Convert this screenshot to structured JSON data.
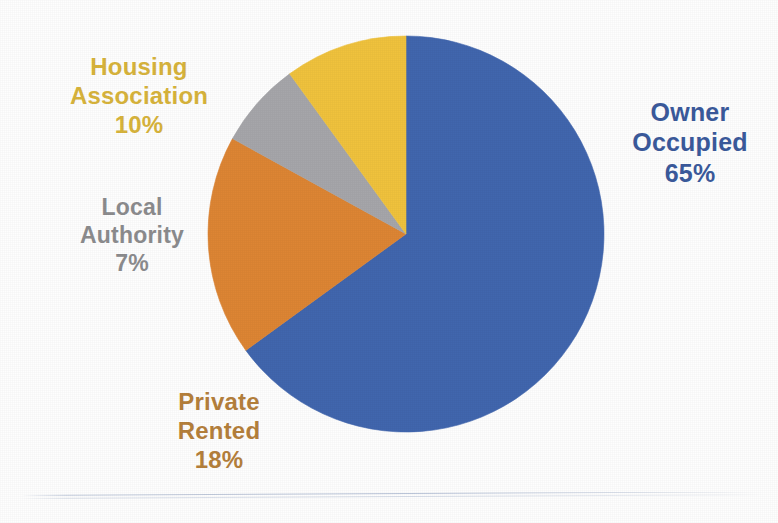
{
  "chart_data": {
    "type": "pie",
    "title": "",
    "subtitle": "",
    "xlabel": "",
    "ylabel": "",
    "legend_position": "none",
    "grid": false,
    "labels_outside": true,
    "label_format": "name + percent",
    "start_angle_deg": 0,
    "direction": "clockwise",
    "center": {
      "x": 406,
      "y": 234,
      "radius": 198
    },
    "categories": [
      "Owner Occupied",
      "Private Rented",
      "Local Authority",
      "Housing Association"
    ],
    "values": [
      65,
      18,
      7,
      10
    ],
    "value_labels": [
      "65%",
      "18%",
      "7%",
      "10%"
    ],
    "colors": [
      "#4166ae",
      "#dd8534",
      "#a6a6aa",
      "#f0c23d"
    ],
    "slices": [
      {
        "name": "Owner Occupied",
        "value": 65,
        "percent_label": "65%",
        "color": "#4166ae",
        "start_deg": 0,
        "end_deg": 234
      },
      {
        "name": "Private Rented",
        "value": 18,
        "percent_label": "18%",
        "color": "#dd8534",
        "start_deg": 234,
        "end_deg": 298.8
      },
      {
        "name": "Local Authority",
        "value": 7,
        "percent_label": "7%",
        "color": "#a6a6aa",
        "start_deg": 298.8,
        "end_deg": 324
      },
      {
        "name": "Housing Association",
        "value": 10,
        "percent_label": "10%",
        "color": "#f0c23d",
        "start_deg": 324,
        "end_deg": 360
      }
    ]
  },
  "labels": {
    "owner_occupied": {
      "line1": "Owner",
      "line2": "Occupied",
      "line3": "65%",
      "color": "#3b5a9c"
    },
    "private_rented": {
      "line1": "Private",
      "line2": "Rented",
      "line3": "18%",
      "color": "#b5803c"
    },
    "local_authority": {
      "line1": "Local",
      "line2": "Authority",
      "line3": "7%",
      "color": "#8c8c8e"
    },
    "housing_association": {
      "line1": "Housing",
      "line2": "Association",
      "line3": "10%",
      "color": "#d8b43c"
    }
  },
  "theme": {
    "background": "#fefefe",
    "blue": "#4166ae",
    "orange": "#dd8534",
    "gray": "#a6a6aa",
    "yellow": "#f0c23d",
    "rule_color": "#aab7d0"
  }
}
